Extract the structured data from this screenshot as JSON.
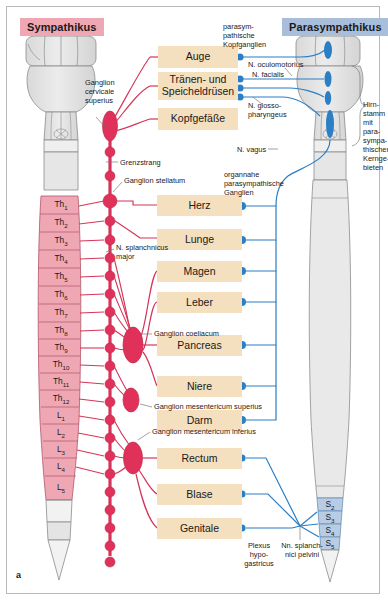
{
  "figure": {
    "label": "a",
    "headers": {
      "sympathetic": "Sympathikus",
      "parasympathetic": "Parasympathikus"
    },
    "colors": {
      "sympathetic_header_bg": "#f0a7b4",
      "parasympathetic_header_bg": "#a8bedb",
      "organ_box_bg": "#f4dfbe",
      "sympathetic_red": "#d6355a",
      "parasympathetic_blue": "#2b7fc4",
      "spinal_cord_grey": "#e2e2e2",
      "vertebra_pink": "#efa8b3",
      "sacral_blue": "#b8cde4",
      "frame_border": "#b9b9b9"
    }
  },
  "organs": [
    {
      "id": "auge",
      "label": "Auge"
    },
    {
      "id": "traenen",
      "label": "Tränen- und\nSpeicheldrüsen"
    },
    {
      "id": "kopfgefaesse",
      "label": "Kopfgefäße"
    },
    {
      "id": "herz",
      "label": "Herz"
    },
    {
      "id": "lunge",
      "label": "Lunge"
    },
    {
      "id": "magen",
      "label": "Magen"
    },
    {
      "id": "leber",
      "label": "Leber"
    },
    {
      "id": "pancreas",
      "label": "Pancreas"
    },
    {
      "id": "niere",
      "label": "Niere"
    },
    {
      "id": "darm",
      "label": "Darm"
    },
    {
      "id": "rectum",
      "label": "Rectum"
    },
    {
      "id": "blase",
      "label": "Blase"
    },
    {
      "id": "genitale",
      "label": "Genitale"
    }
  ],
  "annotations": {
    "ganglion_cervicale_superius": "Ganglion\ncervicale\nsuperius",
    "grenzstrang": "Grenzstrang",
    "ganglion_stellatum": "Ganglion stellatum",
    "n_splanchnicus_major": "N. splanchnicus\nmajor",
    "ganglion_coeliacum": "Ganglion coeliacum",
    "ganglion_mesentericum_superius": "Ganglion mesentericum superius",
    "ganglion_mesentericum_inferius": "Ganglion mesentericum inferius",
    "plexus_hypogastricus": "Plexus\nhypo-\ngastricus",
    "parasympathische_kopfganglien": "parasym-\npathische\nKopfganglien",
    "n_oculomotorius": "N. oculomotorius",
    "n_facialis": "N. facialis",
    "n_glossopharyngeus": "N. glosso-\npharyngeus",
    "n_vagus": "N. vagus",
    "organnahe_ganglien": "organnahe\nparasympathische\nGanglien",
    "hirnstamm": "Hirn-\nstamm\nmit para-\nsympa-\nthischen\nKernge-\nbieten",
    "nn_splanchnici_pelvini": "Nn. splanch-\nnici pelvini"
  },
  "spinal_segments": {
    "sympathetic": [
      {
        "label": "Th",
        "sub": "1",
        "shaded": true
      },
      {
        "label": "Th",
        "sub": "2",
        "shaded": true
      },
      {
        "label": "Th",
        "sub": "3",
        "shaded": true
      },
      {
        "label": "Th",
        "sub": "4",
        "shaded": true
      },
      {
        "label": "Th",
        "sub": "5",
        "shaded": true
      },
      {
        "label": "Th",
        "sub": "6",
        "shaded": true
      },
      {
        "label": "Th",
        "sub": "7",
        "shaded": true
      },
      {
        "label": "Th",
        "sub": "8",
        "shaded": true
      },
      {
        "label": "Th",
        "sub": "9",
        "shaded": true
      },
      {
        "label": "Th",
        "sub": "10",
        "shaded": true
      },
      {
        "label": "Th",
        "sub": "11",
        "shaded": true
      },
      {
        "label": "Th",
        "sub": "12",
        "shaded": true
      },
      {
        "label": "L",
        "sub": "1",
        "shaded": true
      },
      {
        "label": "L",
        "sub": "2",
        "shaded": true
      },
      {
        "label": "L",
        "sub": "3",
        "shaded": true
      },
      {
        "label": "L",
        "sub": "4",
        "shaded": true
      },
      {
        "label": "L",
        "sub": "5",
        "shaded": false
      }
    ],
    "parasympathetic": [
      {
        "label": "S",
        "sub": "2",
        "shaded": true
      },
      {
        "label": "S",
        "sub": "3",
        "shaded": true
      },
      {
        "label": "S",
        "sub": "4",
        "shaded": true
      },
      {
        "label": "S",
        "sub": "5",
        "shaded": true
      }
    ]
  }
}
